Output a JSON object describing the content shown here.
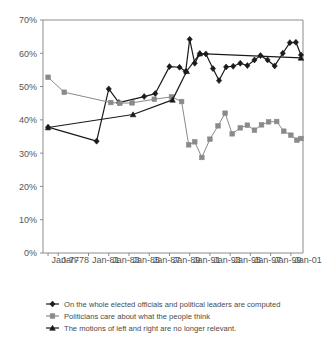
{
  "chart_data": {
    "type": "line",
    "title": "",
    "xlabel": "",
    "ylabel": "",
    "ylim": [
      0,
      70
    ],
    "ytick_labels": [
      "0%",
      "10%",
      "20%",
      "30%",
      "40%",
      "50%",
      "60%",
      "70%"
    ],
    "ytick_values": [
      0,
      10,
      20,
      30,
      40,
      50,
      60,
      70
    ],
    "xtick_labels": [
      "Jan-77",
      "Jan-78",
      "Jan-81",
      "Jan-83",
      "Jan-85",
      "Jan-87",
      "Jan-89",
      "Jan-91",
      "Jan-93",
      "Jan-95",
      "Jan-97",
      "Jan-99",
      "Jan-01"
    ],
    "xtick_values": [
      1977,
      1978,
      1981,
      1983,
      1985,
      1987,
      1989,
      1991,
      1993,
      1995,
      1997,
      1999,
      2001
    ],
    "xlim": [
      1976.5,
      2002.2
    ],
    "grid": false,
    "legend_position": "bottom",
    "series": [
      {
        "name": "On the  whole elected officials and political leaders are computed",
        "color": "#1a1a1a",
        "marker": "diamond",
        "points": [
          {
            "x": 1977.0,
            "y": 37.8
          },
          {
            "x": 1981.8,
            "y": 33.6
          },
          {
            "x": 1983.0,
            "y": 49.3
          },
          {
            "x": 1984.0,
            "y": 45.2
          },
          {
            "x": 1986.5,
            "y": 47.0
          },
          {
            "x": 1987.6,
            "y": 47.9
          },
          {
            "x": 1989.0,
            "y": 56.0
          },
          {
            "x": 1990.0,
            "y": 55.8
          },
          {
            "x": 1990.6,
            "y": 54.5
          },
          {
            "x": 1991.0,
            "y": 64.2
          },
          {
            "x": 1991.5,
            "y": 57.0
          },
          {
            "x": 1992.0,
            "y": 59.9
          },
          {
            "x": 1992.6,
            "y": 59.8
          },
          {
            "x": 1993.3,
            "y": 55.4
          },
          {
            "x": 1993.9,
            "y": 51.8
          },
          {
            "x": 1994.6,
            "y": 55.9
          },
          {
            "x": 1995.3,
            "y": 56.1
          },
          {
            "x": 1996.0,
            "y": 57.0
          },
          {
            "x": 1996.7,
            "y": 56.3
          },
          {
            "x": 1997.4,
            "y": 58.0
          },
          {
            "x": 1998.0,
            "y": 59.3
          },
          {
            "x": 1998.7,
            "y": 58.0
          },
          {
            "x": 1999.4,
            "y": 56.2
          },
          {
            "x": 2000.2,
            "y": 60.0
          },
          {
            "x": 2000.9,
            "y": 63.2
          },
          {
            "x": 2001.5,
            "y": 63.3
          },
          {
            "x": 2002.0,
            "y": 59.5
          }
        ]
      },
      {
        "name": "Politicians care about what the people think",
        "color": "#8a8a8a",
        "marker": "square",
        "points": [
          {
            "x": 1977.0,
            "y": 52.8
          },
          {
            "x": 1978.6,
            "y": 48.3
          },
          {
            "x": 1983.2,
            "y": 45.2
          },
          {
            "x": 1984.1,
            "y": 45.0
          },
          {
            "x": 1985.3,
            "y": 45.1
          },
          {
            "x": 1987.5,
            "y": 46.2
          },
          {
            "x": 1989.2,
            "y": 46.9
          },
          {
            "x": 1990.2,
            "y": 45.5
          },
          {
            "x": 1990.9,
            "y": 32.5
          },
          {
            "x": 1991.5,
            "y": 33.4
          },
          {
            "x": 1992.2,
            "y": 28.7
          },
          {
            "x": 1993.0,
            "y": 34.2
          },
          {
            "x": 1993.8,
            "y": 38.2
          },
          {
            "x": 1994.5,
            "y": 42.0
          },
          {
            "x": 1995.2,
            "y": 35.8
          },
          {
            "x": 1996.0,
            "y": 37.6
          },
          {
            "x": 1996.7,
            "y": 38.4
          },
          {
            "x": 1997.4,
            "y": 36.9
          },
          {
            "x": 1998.1,
            "y": 38.5
          },
          {
            "x": 1998.8,
            "y": 39.4
          },
          {
            "x": 1999.6,
            "y": 39.5
          },
          {
            "x": 2000.3,
            "y": 36.6
          },
          {
            "x": 2001.0,
            "y": 35.4
          },
          {
            "x": 2001.6,
            "y": 33.9
          },
          {
            "x": 2002.0,
            "y": 34.4
          }
        ]
      },
      {
        "name": "The motions of left and right are no longer relevant.",
        "color": "#1a1a1a",
        "marker": "triangle",
        "points": [
          {
            "x": 1977.0,
            "y": 37.7
          },
          {
            "x": 1985.4,
            "y": 41.6
          },
          {
            "x": 1989.3,
            "y": 46.0
          },
          {
            "x": 1990.7,
            "y": 54.6
          },
          {
            "x": 1992.0,
            "y": 59.9
          },
          {
            "x": 2002.0,
            "y": 58.6
          }
        ]
      }
    ]
  },
  "legend": {
    "items": [
      {
        "label": "On the  whole elected officials and political leaders are computed",
        "marker": "diamond-line-marker",
        "color": "#1a1a1a"
      },
      {
        "label": "Politicians care about what the people think",
        "marker": "square-line-marker",
        "color": "#8a8a8a"
      },
      {
        "label": "The motions of left and right are no longer relevant.",
        "marker": "triangle-line-marker",
        "color": "#1a1a1a"
      }
    ]
  }
}
